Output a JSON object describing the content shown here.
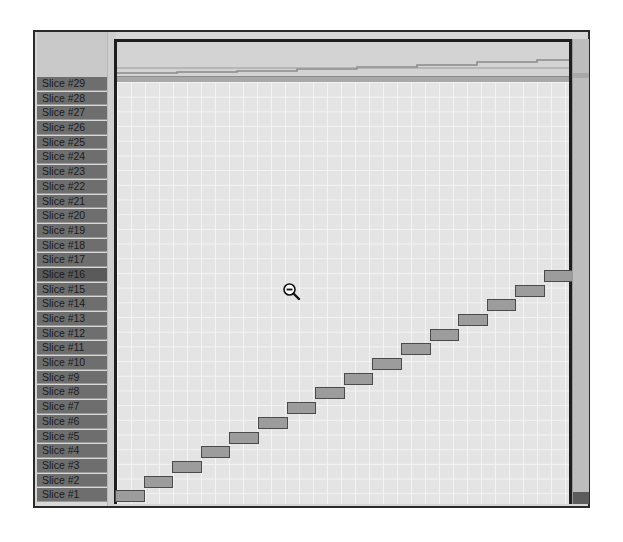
{
  "slice_labels": [
    "Slice #29",
    "Slice #28",
    "Slice #27",
    "Slice #26",
    "Slice #25",
    "Slice #24",
    "Slice #23",
    "Slice #22",
    "Slice #21",
    "Slice #20",
    "Slice #19",
    "Slice #18",
    "Slice #17",
    "Slice #16",
    "Slice #15",
    "Slice #14",
    "Slice #13",
    "Slice #12",
    "Slice #11",
    "Slice #10",
    "Slice #9",
    "Slice #8",
    "Slice #7",
    "Slice #6",
    "Slice #5",
    "Slice #4",
    "Slice #3",
    "Slice #2",
    "Slice #1"
  ],
  "selected_slice": "Slice #16",
  "cursor": {
    "icon": "zoom-out-magnifier-icon"
  },
  "blocks_count": 16,
  "colors": {
    "label_bg": "#6e6e6e",
    "grid_bg": "#e4e4e4",
    "block_fill": "#9c9c9c",
    "block_border": "#4a4a4a",
    "frame": "#1e1e1e"
  }
}
